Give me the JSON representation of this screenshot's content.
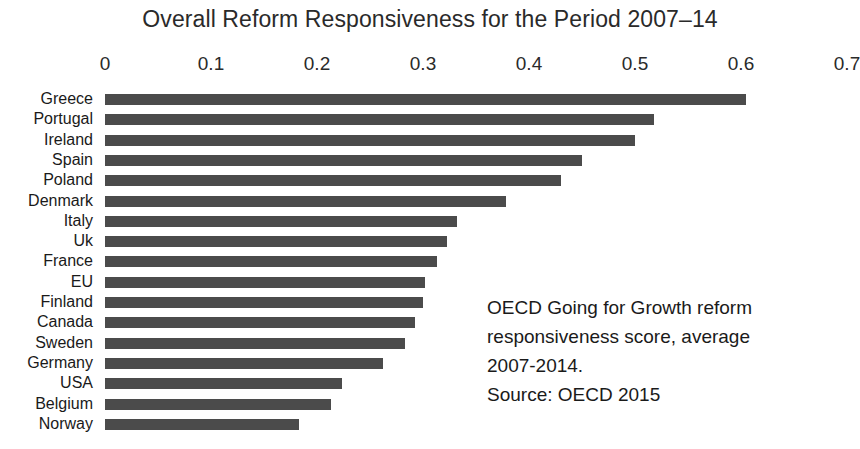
{
  "chart_data": {
    "type": "bar",
    "orientation": "horizontal",
    "title": "Overall Reform Responsiveness for the Period 2007–14",
    "xlabel": "",
    "ylabel": "",
    "xlim": [
      0,
      0.7
    ],
    "grid": false,
    "legend": null,
    "axis_position": "top",
    "tick_labels": [
      "0",
      "0.1",
      "0.2",
      "0.3",
      "0.4",
      "0.5",
      "0.6",
      "0.7"
    ],
    "tick_values": [
      0,
      0.1,
      0.2,
      0.3,
      0.4,
      0.5,
      0.6,
      0.7
    ],
    "categories": [
      "Greece",
      "Portugal",
      "Ireland",
      "Spain",
      "Poland",
      "Denmark",
      "Italy",
      "Uk",
      "France",
      "EU",
      "Finland",
      "Canada",
      "Sweden",
      "Germany",
      "USA",
      "Belgium",
      "Norway"
    ],
    "values": [
      0.605,
      0.518,
      0.5,
      0.45,
      0.43,
      0.378,
      0.332,
      0.323,
      0.313,
      0.302,
      0.3,
      0.292,
      0.283,
      0.262,
      0.224,
      0.213,
      0.183
    ],
    "bar_color": "#4b4b4b",
    "annotation": [
      "OECD Going for Growth reform",
      "responsiveness score, average",
      "2007-2014.",
      "Source: OECD 2015"
    ]
  }
}
